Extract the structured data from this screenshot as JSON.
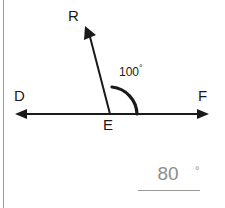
{
  "figure": {
    "type": "angle-diagram",
    "points": {
      "vertex_label": "E",
      "left_ray_label": "D",
      "right_ray_label": "F",
      "upper_ray_label": "R"
    },
    "angle_label": {
      "value": "100",
      "degree_symbol": "°"
    },
    "colors": {
      "stroke": "#1a1a1a",
      "border": "#9a9a9a",
      "answer_text": "#8d8d8d",
      "background": "#ffffff"
    }
  },
  "answer": {
    "value": "80",
    "degree_symbol": "°"
  }
}
